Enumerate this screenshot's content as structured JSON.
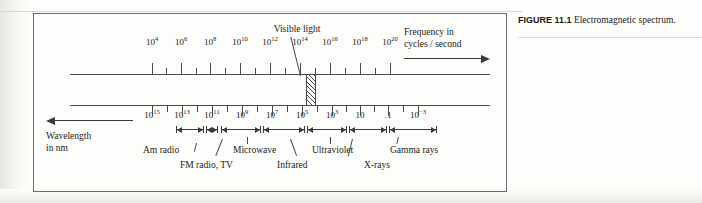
{
  "figure": {
    "caption_label": "FIGURE 11.1",
    "caption_text": "Electromagnetic spectrum."
  },
  "diagram": {
    "visible_light_label": "Visible light",
    "frequency_caption_line1": "Frequency in",
    "frequency_caption_line2": "cycles / second",
    "wavelength_caption_line1": "Wavelength",
    "wavelength_caption_line2": "in nm",
    "frequency_scale": {
      "axis_title": "Frequency in cycles / second",
      "labels": [
        {
          "base": "10",
          "exp": "4",
          "x": 152
        },
        {
          "base": "10",
          "exp": "6",
          "x": 181
        },
        {
          "base": "10",
          "exp": "8",
          "x": 210
        },
        {
          "base": "10",
          "exp": "10",
          "x": 240
        },
        {
          "base": "10",
          "exp": "12",
          "x": 270
        },
        {
          "base": "10",
          "exp": "14",
          "x": 300
        },
        {
          "base": "10",
          "exp": "16",
          "x": 330
        },
        {
          "base": "10",
          "exp": "18",
          "x": 360
        },
        {
          "base": "10",
          "exp": "20",
          "x": 390
        }
      ]
    },
    "wavelength_scale": {
      "axis_title": "Wavelength in nm",
      "labels": [
        {
          "base": "10",
          "exp": "15",
          "x": 152
        },
        {
          "base": "10",
          "exp": "13",
          "x": 182
        },
        {
          "base": "10",
          "exp": "11",
          "x": 212
        },
        {
          "base": "10",
          "exp": "9",
          "x": 242
        },
        {
          "base": "10",
          "exp": "7",
          "x": 272
        },
        {
          "base": "10",
          "exp": "5",
          "x": 302
        },
        {
          "base": "10",
          "exp": "3",
          "x": 332
        },
        {
          "base": "10",
          "exp": "",
          "x": 360
        },
        {
          "base": ".1",
          "exp": "",
          "x": 388
        },
        {
          "base": "10",
          "exp": "−3",
          "x": 418
        }
      ]
    },
    "bands": [
      {
        "name": "Am radio",
        "label_x": 143,
        "label_y": 146,
        "range_x": 176,
        "range_w": 28,
        "leader_x1": 196,
        "leader_y1": 143,
        "leader_h": 9,
        "leader_rot": 14
      },
      {
        "name": "FM radio, TV",
        "label_x": 180,
        "label_y": 161,
        "range_x": 206,
        "range_w": 12,
        "leader_x1": 222,
        "leader_y1": 139,
        "leader_h": 18,
        "leader_rot": 22
      },
      {
        "name": "Microwave",
        "label_x": 233,
        "label_y": 146,
        "range_x": 221,
        "range_w": 40,
        "leader_x1": 247,
        "leader_y1": 137,
        "leader_h": 7,
        "leader_rot": 0
      },
      {
        "name": "Infrared",
        "label_x": 277,
        "label_y": 161,
        "range_x": 263,
        "range_w": 42,
        "leader_x1": 290,
        "leader_y1": 139,
        "leader_h": 18,
        "leader_rot": -20
      },
      {
        "name": "Ultraviolet",
        "label_x": 312,
        "label_y": 146,
        "range_x": 307,
        "range_w": 40,
        "leader_x1": 330,
        "leader_y1": 137,
        "leader_h": 7,
        "leader_rot": 0
      },
      {
        "name": "X-rays",
        "label_x": 364,
        "label_y": 161,
        "range_x": 349,
        "range_w": 38,
        "leader_x1": 352,
        "leader_y1": 139,
        "leader_h": 18,
        "leader_rot": 14
      },
      {
        "name": "Gamma rays",
        "label_x": 390,
        "label_y": 146,
        "range_x": 389,
        "range_w": 48,
        "leader_x1": 398,
        "leader_y1": 137,
        "leader_h": 7,
        "leader_rot": 14
      }
    ],
    "frequency_ticks_x": [
      152,
      166,
      181,
      196,
      210,
      225,
      240,
      255,
      270,
      285,
      300,
      315,
      330,
      345,
      360,
      375,
      390
    ],
    "wavelength_ticks_x": [
      152,
      167,
      182,
      197,
      212,
      227,
      242,
      257,
      272,
      287,
      302,
      317,
      332,
      346,
      360,
      374,
      388,
      403,
      418
    ]
  }
}
